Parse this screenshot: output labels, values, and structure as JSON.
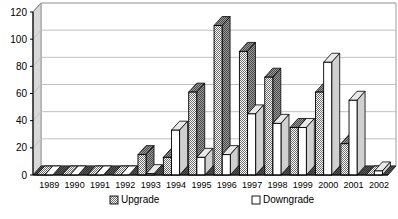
{
  "chart_data": {
    "type": "bar",
    "title": "",
    "subtitle": "",
    "xlabel": "",
    "ylabel": "",
    "ylim": [
      0,
      120
    ],
    "yticks": [
      0,
      20,
      40,
      60,
      80,
      100,
      120
    ],
    "ytick_labels": [
      "0",
      "20",
      "40",
      "60",
      "80",
      "100",
      "120"
    ],
    "grid": true,
    "legend_position": "bottom",
    "style": "excel-3d-clustered-column",
    "categories": [
      "1989",
      "1990",
      "1991",
      "1992",
      "1993",
      "1994",
      "1995",
      "1996",
      "1997",
      "1998",
      "1999",
      "2000",
      "2001",
      "2002"
    ],
    "series": [
      {
        "name": "Upgrade",
        "color": "#a8a8a8",
        "pattern": "dithered-gray",
        "values": [
          0,
          0,
          0,
          0,
          15,
          13,
          61,
          110,
          91,
          72,
          35,
          61,
          23,
          0
        ]
      },
      {
        "name": "Downgrade",
        "color": "#ffffff",
        "pattern": "solid-white",
        "values": [
          0,
          0,
          0,
          0,
          1,
          33,
          13,
          15,
          45,
          38,
          35,
          83,
          55,
          3
        ]
      }
    ]
  },
  "legend": {
    "items": [
      {
        "label": "Upgrade",
        "swatch": "upgrade-swatch"
      },
      {
        "label": "Downgrade",
        "swatch": "downgrade-swatch"
      }
    ]
  },
  "colors": {
    "axis": "#000000",
    "gridline": "#c0c0c0",
    "plot_background": "#ffffff",
    "floor": "#404040",
    "wall_side": "#d9d9d9",
    "upgrade_fill": "#a8a8a8",
    "downgrade_fill": "#ffffff",
    "bar_outline": "#000000"
  }
}
